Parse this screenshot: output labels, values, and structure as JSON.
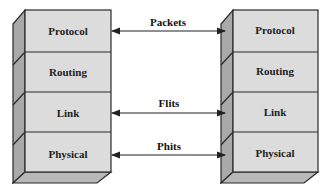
{
  "diagram": {
    "left_stack": {
      "layers": [
        {
          "label": "Protocol"
        },
        {
          "label": "Routing"
        },
        {
          "label": "Link"
        },
        {
          "label": "Physical"
        }
      ]
    },
    "right_stack": {
      "layers": [
        {
          "label": "Protocol"
        },
        {
          "label": "Routing"
        },
        {
          "label": "Link"
        },
        {
          "label": "Physical"
        }
      ]
    },
    "connections": [
      {
        "label": "Packets",
        "from": "Protocol",
        "to": "Protocol"
      },
      {
        "label": "Flits",
        "from": "Link",
        "to": "Link"
      },
      {
        "label": "Phits",
        "from": "Physical",
        "to": "Physical"
      }
    ],
    "colors": {
      "front_face": "#dcdcdc",
      "side_face": "#a9a9a9",
      "bottom_face": "#b8b8b8",
      "outline": "#2a2a2a",
      "arrow": "#222222"
    }
  }
}
